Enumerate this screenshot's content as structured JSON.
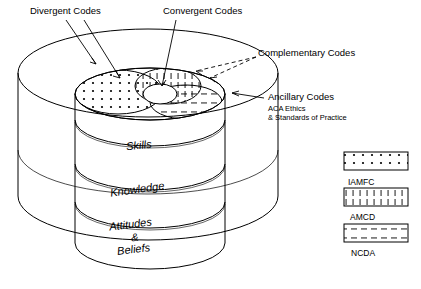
{
  "figure": {
    "labels": {
      "divergent": "Divergent Codes",
      "convergent": "Convergent Codes",
      "complementary": "Complementary Codes",
      "ancillary": "Ancillary Codes",
      "ancillary_sub1": "ACA Ethics",
      "ancillary_sub2": "& Standards of Practice"
    },
    "cylinders": [
      {
        "label": "Skills"
      },
      {
        "label": "Knowledge"
      },
      {
        "label": "Attitudes"
      },
      {
        "label": "&"
      },
      {
        "label": "Beliefs"
      }
    ],
    "legend": [
      {
        "name": "IAMFC",
        "pattern": "dots"
      },
      {
        "name": "AMCD",
        "pattern": "vertical-ticks"
      },
      {
        "name": "NCDA",
        "pattern": "dashes"
      }
    ],
    "colors": {
      "stroke": "#000000",
      "background": "#ffffff"
    }
  }
}
